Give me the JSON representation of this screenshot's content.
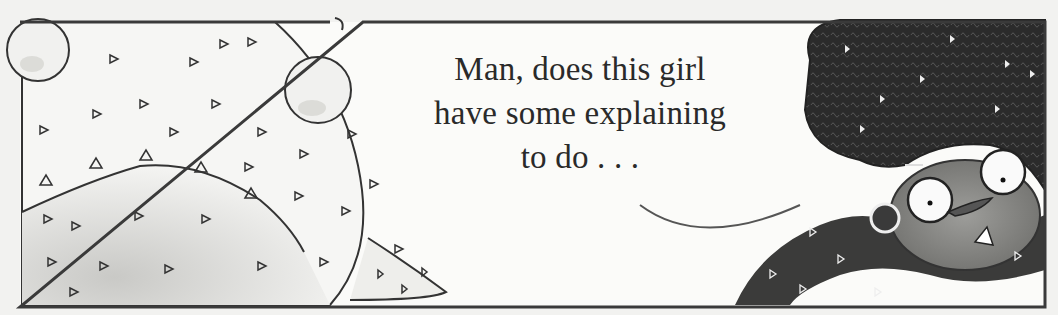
{
  "panel": {
    "caption_lines": [
      "Man, does this girl",
      "have some explaining",
      "to do . . ."
    ]
  },
  "colors": {
    "paper": "#f2f2f0",
    "panel_bg": "#fbfbf9",
    "ink": "#2a2a2a",
    "hair": "#2b2b2b",
    "skin_shade": "#8a8a88",
    "pale_body": "#e6e6e3"
  }
}
